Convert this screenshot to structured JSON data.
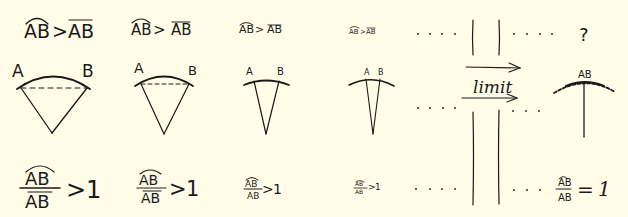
{
  "colors": {
    "background": "#fffde8",
    "ink": "#1a1a1a"
  },
  "top_row": [
    {
      "arc": "AB",
      "op": ">",
      "chord": "AB"
    },
    {
      "arc": "AB",
      "op": ">",
      "chord": "AB"
    },
    {
      "arc": "AB",
      "op": ">",
      "chord": "AB"
    },
    {
      "arc": "AB",
      "op": ">",
      "chord": "AB"
    }
  ],
  "top_right": {
    "result": "?"
  },
  "sectors": [
    {
      "label_a": "A",
      "label_b": "B"
    },
    {
      "label_a": "A",
      "label_b": "B"
    },
    {
      "label_a": "A",
      "label_b": "B"
    },
    {
      "label_a": "A",
      "label_b": "B"
    }
  ],
  "limit_sector": {
    "label": "AB"
  },
  "limit_label": "limit",
  "bottom_row": [
    {
      "numerator": "AB",
      "denominator": "AB",
      "op": ">",
      "value": "1"
    },
    {
      "numerator": "AB",
      "denominator": "AB",
      "op": ">",
      "value": "1"
    },
    {
      "numerator": "AB",
      "denominator": "AB",
      "op": ">",
      "value": "1"
    },
    {
      "numerator": "AB",
      "denominator": "AB",
      "op": ">",
      "value": "1"
    }
  ],
  "bottom_right": {
    "numerator": "AB",
    "denominator": "AB",
    "op": "=",
    "value": "1"
  },
  "ellipsis": ". . . ."
}
